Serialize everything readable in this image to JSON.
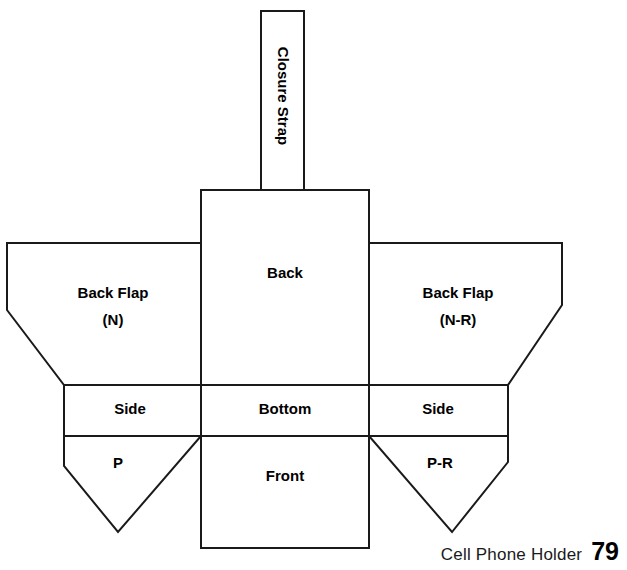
{
  "document": {
    "title": "Cell Phone Holder",
    "page_number": "79"
  },
  "footer": {
    "caption": "Cell Phone Holder",
    "page_number": "79"
  },
  "diagram": {
    "type": "sewing-pattern-layout",
    "stroke_color": "#1a1a1a",
    "fill_color": "#ffffff",
    "text_color": "#000000",
    "panels": [
      {
        "id": "closure-strap",
        "label": "Closure Strap",
        "orientation": "vertical",
        "shape": "rectangle",
        "points": "261,11 304,11 304,190 261,190",
        "label_x": 282,
        "label_y": 96
      },
      {
        "id": "back",
        "label": "Back",
        "orientation": "horizontal",
        "shape": "rectangle",
        "points": "201,190 369,190 369,385 201,385",
        "label_x": 285,
        "label_y": 274
      },
      {
        "id": "back-flap-left",
        "label": "Back Flap",
        "sublabel": "(N)",
        "orientation": "horizontal",
        "shape": "pentagon",
        "points": "7,243 201,243 201,385 64,385 7,310",
        "label_x": 113,
        "label_y": 294,
        "sublabel_x": 113,
        "sublabel_y": 321
      },
      {
        "id": "back-flap-right",
        "label": "Back Flap",
        "sublabel": "(N-R)",
        "orientation": "horizontal",
        "shape": "pentagon",
        "points": "369,243 562,243 562,305 508,385 369,385",
        "label_x": 458,
        "label_y": 294,
        "sublabel_x": 458,
        "sublabel_y": 321
      },
      {
        "id": "side-left",
        "label": "Side",
        "orientation": "horizontal",
        "shape": "rectangle",
        "points": "64,385 201,385 201,436 64,436",
        "label_x": 130,
        "label_y": 410
      },
      {
        "id": "bottom",
        "label": "Bottom",
        "orientation": "horizontal",
        "shape": "rectangle",
        "points": "201,385 369,385 369,436 201,436",
        "label_x": 285,
        "label_y": 410
      },
      {
        "id": "side-right",
        "label": "Side",
        "orientation": "horizontal",
        "shape": "rectangle",
        "points": "369,385 508,385 508,436 369,436",
        "label_x": 438,
        "label_y": 410
      },
      {
        "id": "pocket-left",
        "label": "P",
        "orientation": "horizontal",
        "shape": "point-down-flap",
        "points": "64,436 201,436 118,532 64,466",
        "label_x": 118,
        "label_y": 464
      },
      {
        "id": "front",
        "label": "Front",
        "orientation": "horizontal",
        "shape": "rectangle",
        "points": "201,436 369,436 369,548 201,548",
        "label_x": 285,
        "label_y": 477
      },
      {
        "id": "pocket-right",
        "label": "P-R",
        "orientation": "horizontal",
        "shape": "point-down-flap",
        "points": "369,436 508,436 508,462 452,532",
        "label_x": 440,
        "label_y": 464
      }
    ]
  }
}
